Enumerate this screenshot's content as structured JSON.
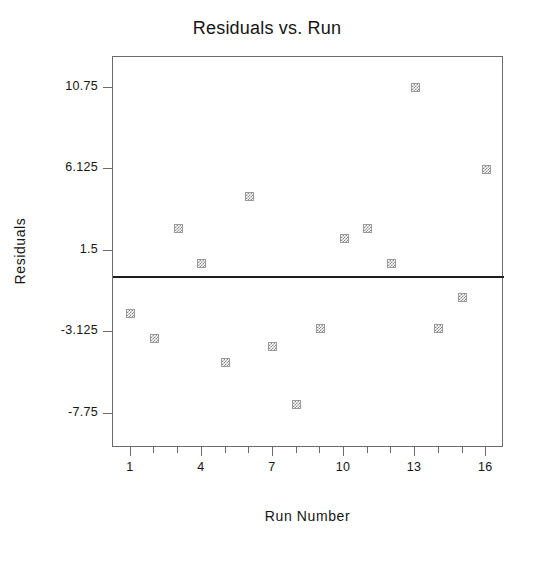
{
  "chart_data": {
    "type": "scatter",
    "title": "Residuals vs. Run",
    "xlabel": "Run Number",
    "ylabel": "Residuals",
    "x": [
      1,
      2,
      3,
      4,
      5,
      6,
      7,
      8,
      9,
      10,
      11,
      12,
      13,
      14,
      15,
      16
    ],
    "values": [
      -2.04,
      -3.48,
      2.74,
      0.8,
      -4.87,
      4.58,
      -3.93,
      -7.21,
      -2.93,
      2.19,
      2.74,
      0.8,
      10.75,
      -2.93,
      -1.14,
      6.125
    ],
    "series": [
      {
        "name": "Residuals",
        "values": [
          -2.04,
          -3.48,
          2.74,
          0.8,
          -4.87,
          4.58,
          -3.93,
          -7.21,
          -2.93,
          2.19,
          2.74,
          0.8,
          10.75,
          -2.93,
          -1.14,
          6.125
        ]
      }
    ],
    "xlim": [
      0.25,
      16.75
    ],
    "ylim": [
      -9.7,
      12.5
    ],
    "xticks": [
      1,
      4,
      7,
      10,
      13,
      16
    ],
    "xtick_labels": [
      "1",
      "4",
      "7",
      "10",
      "13",
      "16"
    ],
    "xticks_minor": [
      2,
      3,
      5,
      6,
      8,
      9,
      11,
      12,
      14,
      15
    ],
    "yticks": [
      10.75,
      6.125,
      1.5,
      -3.125,
      -7.75
    ],
    "ytick_labels": [
      "10.75",
      "6.125",
      "1.5",
      "-3.125",
      "-7.75"
    ],
    "reference_line": {
      "name": "zero-line",
      "y": 0,
      "color": "#1d1d1d"
    },
    "grid": false,
    "legend": null,
    "marker": {
      "shape": "square",
      "style": "checkered-gray",
      "color": "#8a8a8a",
      "edge_color": "#9a9a9a",
      "size_px": 9
    },
    "frame_color": "#6b6b6b",
    "background": "#ffffff"
  }
}
